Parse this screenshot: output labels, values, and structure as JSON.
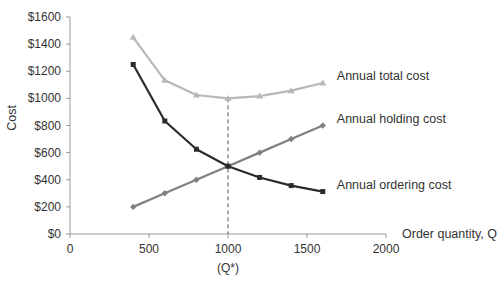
{
  "chart_data": {
    "type": "line",
    "title": "",
    "xlabel": "Order quantity, Q",
    "ylabel": "Cost",
    "xlim": [
      0,
      2000
    ],
    "ylim": [
      0,
      1600
    ],
    "x_ticks": [
      0,
      500,
      1000,
      1500,
      2000
    ],
    "y_ticks": [
      0,
      200,
      400,
      600,
      800,
      1000,
      1200,
      1400,
      1600
    ],
    "y_tick_labels": [
      "$0",
      "$200",
      "$400",
      "$600",
      "$800",
      "$1000",
      "$1200",
      "$1400",
      "$1600"
    ],
    "x_tick_labels": [
      "0",
      "500",
      "1000",
      "1500",
      "2000"
    ],
    "grid": false,
    "legend_position": "inline-right",
    "x": [
      400,
      600,
      800,
      1000,
      1200,
      1400,
      1600
    ],
    "series": [
      {
        "name": "Annual total cost",
        "values": [
          1450,
          1133,
          1025,
          1000,
          1017,
          1057,
          1113
        ],
        "color": "#b8b8b8",
        "marker": "triangle"
      },
      {
        "name": "Annual holding cost",
        "values": [
          200,
          300,
          400,
          500,
          600,
          700,
          800
        ],
        "color": "#808080",
        "marker": "diamond"
      },
      {
        "name": "Annual ordering cost",
        "values": [
          1250,
          833,
          625,
          500,
          417,
          357,
          313
        ],
        "color": "#2b2b2b",
        "marker": "square"
      }
    ],
    "annotations": [
      {
        "type": "vertical-dashed-line",
        "x": 1000,
        "from_y": 0,
        "to_y": 1000,
        "label": "(Q*)"
      }
    ]
  }
}
